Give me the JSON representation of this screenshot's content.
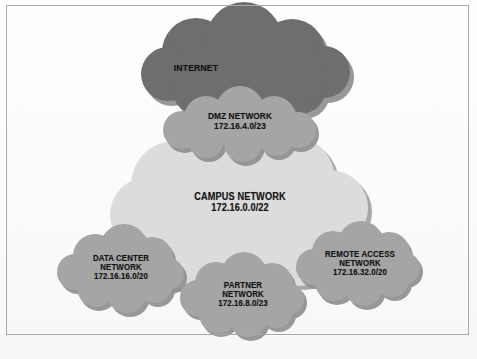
{
  "figure": {
    "background_color": "#fdfdfc",
    "frame_color": "#a9a9a9",
    "label_color": "#141414"
  },
  "palette": {
    "internet_fill": "#6e6e6e",
    "mid_fill": "#a5a5a5",
    "campus_fill": "#dcdcdc",
    "shadow": "#8e8e8e"
  },
  "clouds": [
    {
      "id": "internet",
      "name": "INTERNET",
      "subnet": "",
      "fill": "#6e6e6e",
      "tier": "external"
    },
    {
      "id": "dmz",
      "name": "DMZ NETWORK",
      "subnet": "172.16.4.0/23",
      "fill": "#a5a5a5",
      "tier": "perimeter"
    },
    {
      "id": "campus",
      "name": "CAMPUS NETWORK",
      "subnet": "172.16.0.0/22",
      "fill": "#dcdcdc",
      "tier": "core"
    },
    {
      "id": "data-center",
      "name": "DATA CENTER NETWORK",
      "name_line1": "DATA CENTER",
      "name_line2": "NETWORK",
      "subnet": "172.16.16.0/20",
      "fill": "#a5a5a5",
      "tier": "edge"
    },
    {
      "id": "partner",
      "name": "PARTNER NETWORK",
      "name_line1": "PARTNER",
      "name_line2": "NETWORK",
      "subnet": "172.16.8.0/23",
      "fill": "#a5a5a5",
      "tier": "edge"
    },
    {
      "id": "remote-access",
      "name": "REMOTE ACCESS NETWORK",
      "name_line1": "REMOTE ACCESS",
      "name_line2": "NETWORK",
      "subnet": "172.16.32.0/20",
      "fill": "#a5a5a5",
      "tier": "edge"
    }
  ],
  "labels": {
    "internet": "INTERNET",
    "dmz_name": "DMZ NETWORK",
    "dmz_subnet": "172.16.4.0/23",
    "campus_name": "CAMPUS NETWORK",
    "campus_subnet": "172.16.0.0/22",
    "dc_name1": "DATA CENTER",
    "dc_name2": "NETWORK",
    "dc_subnet": "172.16.16.0/20",
    "partner_name1": "PARTNER",
    "partner_name2": "NETWORK",
    "partner_subnet": "172.16.8.0/23",
    "ra_name1": "REMOTE ACCESS",
    "ra_name2": "NETWORK",
    "ra_subnet": "172.16.32.0/20"
  }
}
